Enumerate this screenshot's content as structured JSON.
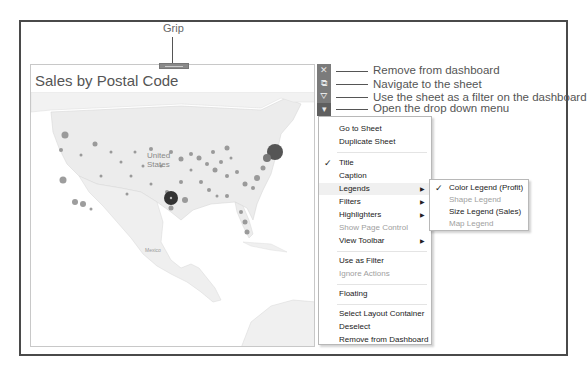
{
  "annotations": {
    "grip": "Grip",
    "remove": "Remove from dashboard",
    "navigate": "Navigate to the sheet",
    "filter": "Use the sheet as a filter on the dashboard",
    "dropdown": "Open the drop down menu"
  },
  "sheet": {
    "title": "Sales by Postal Code",
    "map_labels": {
      "country": "United States",
      "country_line1": "United",
      "country_line2": "States",
      "mexico": "Mexico"
    }
  },
  "toolbar": {
    "buttons": [
      {
        "icon": "close-icon",
        "glyph": "✕"
      },
      {
        "icon": "navigate-sheet-icon",
        "glyph": "⧉"
      },
      {
        "icon": "filter-icon",
        "glyph": "⛛"
      },
      {
        "icon": "dropdown-icon",
        "glyph": "▾"
      }
    ]
  },
  "menu": {
    "items": [
      {
        "label": "Go to Sheet",
        "checked": false,
        "submenu": false,
        "disabled": false
      },
      {
        "label": "Duplicate Sheet",
        "checked": false,
        "submenu": false,
        "disabled": false
      },
      {
        "label": "Title",
        "checked": true,
        "submenu": false,
        "disabled": false
      },
      {
        "label": "Caption",
        "checked": false,
        "submenu": false,
        "disabled": false
      },
      {
        "label": "Legends",
        "checked": false,
        "submenu": true,
        "disabled": false
      },
      {
        "label": "Filters",
        "checked": false,
        "submenu": true,
        "disabled": false
      },
      {
        "label": "Highlighters",
        "checked": false,
        "submenu": true,
        "disabled": false
      },
      {
        "label": "Show Page Control",
        "checked": false,
        "submenu": false,
        "disabled": true
      },
      {
        "label": "View Toolbar",
        "checked": false,
        "submenu": true,
        "disabled": false
      },
      {
        "label": "Use as Filter",
        "checked": false,
        "submenu": false,
        "disabled": false
      },
      {
        "label": "Ignore Actions",
        "checked": false,
        "submenu": false,
        "disabled": true
      },
      {
        "label": "Floating",
        "checked": false,
        "submenu": false,
        "disabled": false
      },
      {
        "label": "Select Layout Container",
        "checked": false,
        "submenu": false,
        "disabled": false
      },
      {
        "label": "Deselect",
        "checked": false,
        "submenu": false,
        "disabled": false
      },
      {
        "label": "Remove from Dashboard",
        "checked": false,
        "submenu": false,
        "disabled": false
      }
    ],
    "check_glyph": "✓",
    "arrow_glyph": "▶"
  },
  "legends_submenu": {
    "items": [
      {
        "label": "Color Legend (Profit)",
        "checked": true,
        "disabled": false
      },
      {
        "label": "Shape Legend",
        "checked": false,
        "disabled": true
      },
      {
        "label": "Size Legend (Sales)",
        "checked": false,
        "disabled": false
      },
      {
        "label": "Map Legend",
        "checked": false,
        "disabled": true
      }
    ]
  },
  "colors": {
    "frame": "#4a4a4a",
    "toolbar": "#7b7b7b",
    "toolbar_active": "#5f5f5f",
    "land": "#ececec",
    "dot": "#8c8c8c",
    "dot_dark": "#3c3c3c",
    "disabled_text": "#a0a0a0"
  }
}
